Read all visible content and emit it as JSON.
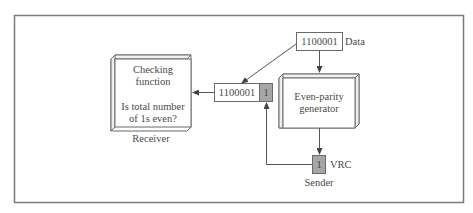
{
  "diagram": {
    "receiver": {
      "box_lines": [
        "Checking",
        "function",
        "",
        "Is total number",
        "of 1s even?"
      ],
      "caption": "Receiver"
    },
    "transmitted": {
      "data_bits": "1100001",
      "parity_bit": "1"
    },
    "source": {
      "data_bits": "1100001",
      "label": "Data"
    },
    "generator": {
      "box_lines": [
        "Even-parity",
        "generator"
      ]
    },
    "vrc": {
      "bit": "1",
      "label": "VRC",
      "caption": "Sender"
    },
    "colors": {
      "frame": "#7a7a7a",
      "box_stroke": "#6a6a6a",
      "parity_fill": "#a6a6a6",
      "text": "#4a4a4a",
      "background": "#ffffff"
    }
  }
}
